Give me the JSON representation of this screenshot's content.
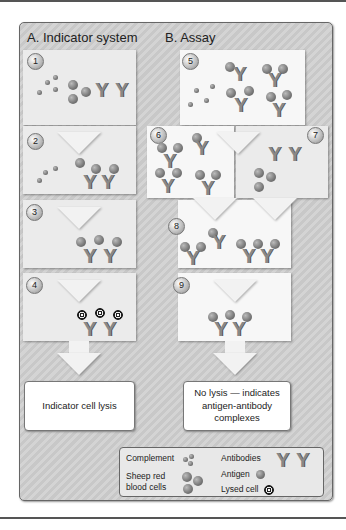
{
  "headers": {
    "a": "A. Indicator system",
    "b": "B. Assay"
  },
  "steps": [
    "1",
    "2",
    "3",
    "4",
    "5",
    "6",
    "7",
    "8",
    "9"
  ],
  "results": {
    "a": "Indicator cell lysis",
    "b": "No lysis — indicates antigen-antibody complexes"
  },
  "legend": {
    "complement": "Complement",
    "srbc_line1": "Sheep red",
    "srbc_line2": "blood cells",
    "antibodies": "Antibodies",
    "antigen": "Antigen",
    "lysed": "Lysed cell"
  },
  "glyphs": {
    "antibody": "Y"
  },
  "colors": {
    "frame": "#cccccc",
    "panel": "#ebebeb",
    "ball": "#777777"
  }
}
